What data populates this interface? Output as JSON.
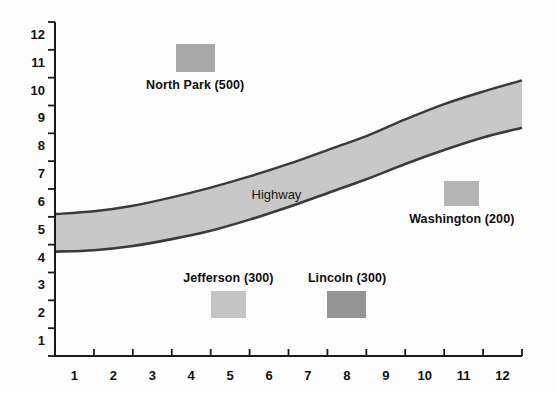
{
  "chart_data": {
    "type": "area",
    "title": "",
    "xlabel": "",
    "ylabel": "",
    "xlim": [
      0.5,
      12.5
    ],
    "ylim": [
      0.5,
      12.5
    ],
    "grid": false,
    "legend_position": "inline-annotations",
    "x_tick_labels": [
      "1",
      "2",
      "3",
      "4",
      "5",
      "6",
      "7",
      "8",
      "9",
      "10",
      "11",
      "12"
    ],
    "y_tick_labels": [
      "1",
      "2",
      "3",
      "4",
      "5",
      "6",
      "7",
      "8",
      "9",
      "10",
      "11",
      "12"
    ],
    "band": {
      "name": "Highway",
      "label": "Highway",
      "fill_color": "#c8c8c8",
      "edge_color": "#3a3a3a",
      "x": [
        0.5,
        1.5,
        2.5,
        3.5,
        4.5,
        5.5,
        6.5,
        7.5,
        8.5,
        9.5,
        10.5,
        11.5,
        12.5
      ],
      "upper": [
        5.6,
        5.7,
        5.9,
        6.2,
        6.55,
        6.95,
        7.4,
        7.9,
        8.4,
        9.0,
        9.55,
        10.0,
        10.4
      ],
      "lower": [
        4.25,
        4.3,
        4.45,
        4.7,
        5.0,
        5.4,
        5.85,
        6.35,
        6.85,
        7.4,
        7.9,
        8.35,
        8.7
      ]
    },
    "markers": [
      {
        "label": "North Park (500)",
        "name": "North Park",
        "value": 500,
        "x_range": [
          3.6,
          4.6
        ],
        "y_range": [
          10.7,
          11.7
        ],
        "color": "#a8a8a8"
      },
      {
        "label": "Washington (200)",
        "name": "Washington",
        "value": 200,
        "x_range": [
          10.5,
          11.4
        ],
        "y_range": [
          5.9,
          6.8
        ],
        "color": "#b4b4b4"
      },
      {
        "label": "Jefferson (300)",
        "name": "Jefferson",
        "value": 300,
        "x_range": [
          4.5,
          5.4
        ],
        "y_range": [
          1.85,
          2.85
        ],
        "color": "#c4c4c4"
      },
      {
        "label": "Lincoln (300)",
        "name": "Lincoln",
        "value": 300,
        "x_range": [
          7.5,
          8.5
        ],
        "y_range": [
          1.85,
          2.85
        ],
        "color": "#949494"
      }
    ]
  },
  "axes": {
    "axis_color": "#1a1a1a"
  }
}
